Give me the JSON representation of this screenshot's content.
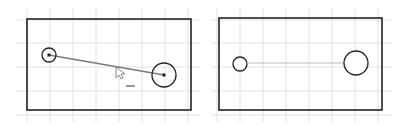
{
  "canvas": {
    "width": 411,
    "height": 125,
    "background": "#ffffff"
  },
  "colors": {
    "grid": "#e2e2e2",
    "outline": "#222222",
    "constraint_line": "#7a7a7a",
    "construction_line": "#bdbdbd",
    "point": "#222222",
    "cursor": "#888888"
  },
  "panels": [
    {
      "id": "before",
      "grid": {
        "x_lines": [
          27,
          50,
          73,
          96,
          119,
          142,
          165,
          188
        ],
        "y_lines": [
          20,
          43,
          67,
          91,
          115
        ],
        "x_min": 16,
        "x_max": 200,
        "y_min": 8,
        "y_max": 122
      },
      "rectangle": {
        "x": 27,
        "y": 19,
        "width": 164,
        "height": 91
      },
      "small_circle": {
        "cx": 49,
        "cy": 55,
        "r": 7,
        "center_point": true
      },
      "large_circle": {
        "cx": 164,
        "cy": 75,
        "r": 12,
        "center_point": true
      },
      "connector_line": {
        "x1": 49,
        "y1": 55,
        "x2": 164,
        "y2": 75,
        "style": "solid"
      },
      "cursor": {
        "x": 116,
        "y": 67,
        "icon": "arrow-pointer-icon"
      },
      "dash_mark": {
        "x1": 126,
        "y1": 86,
        "x2": 135,
        "y2": 86
      }
    },
    {
      "id": "after",
      "grid": {
        "x_lines": [
          217,
          240,
          263,
          286,
          309,
          332,
          355,
          378
        ],
        "y_lines": [
          20,
          43,
          67,
          91,
          115
        ],
        "x_min": 211,
        "x_max": 392,
        "y_min": 8,
        "y_max": 122
      },
      "rectangle": {
        "x": 219,
        "y": 18,
        "width": 163,
        "height": 92
      },
      "small_circle": {
        "cx": 240,
        "cy": 64,
        "r": 7,
        "center_point": false
      },
      "large_circle": {
        "cx": 356,
        "cy": 63,
        "r": 12,
        "center_point": false
      },
      "connector_line": {
        "x1": 247,
        "y1": 63,
        "x2": 356,
        "y2": 63,
        "style": "thin"
      }
    }
  ]
}
